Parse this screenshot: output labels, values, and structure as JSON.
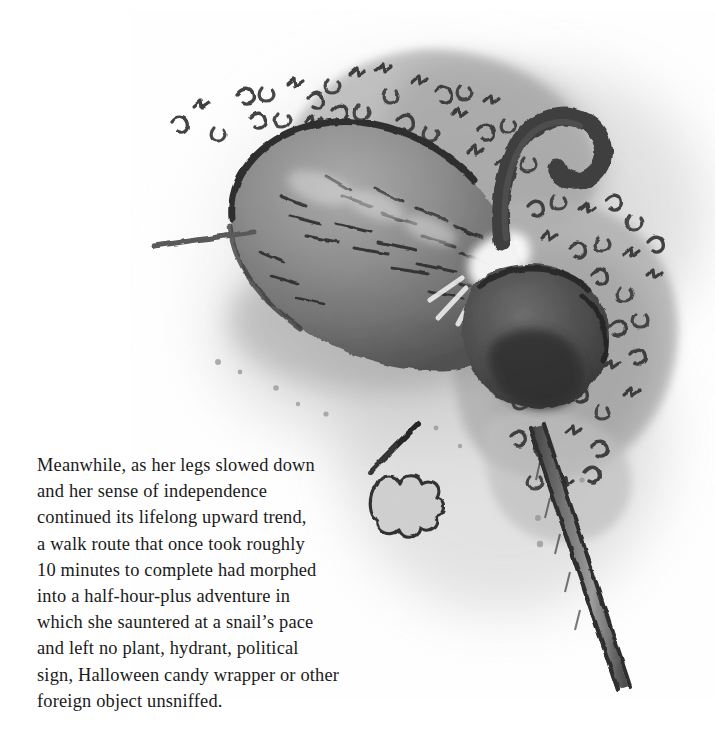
{
  "page": {
    "background_color": "#ffffff",
    "width": 715,
    "height": 747,
    "kind": "book-page-illustration-with-caption"
  },
  "illustration": {
    "title": "Dog sniffing in roadside bushes",
    "medium": "grayscale ink and wash drawing",
    "description": "Overhead rear view of a shaggy dog with a curled-up tail, nose buried in a clump of leafy bushes; a leaning sign post or plant stem runs down to the lower right and a small leaf with a twig sits at the lower left.",
    "elements": [
      {
        "name": "dog-body",
        "label": "Dog body"
      },
      {
        "name": "dog-tail",
        "label": "Curled tail"
      },
      {
        "name": "dog-head",
        "label": "Head buried in bush"
      },
      {
        "name": "bush-cluster",
        "label": "Leafy bush cluster"
      },
      {
        "name": "sign-post",
        "label": "Leaning post or stem"
      },
      {
        "name": "ground-shadow",
        "label": "Ground shadow wash"
      },
      {
        "name": "small-leaf",
        "label": "Small fallen leaf"
      },
      {
        "name": "twig",
        "label": "Thin twig"
      }
    ],
    "palette": {
      "ink": "#2f2f2f",
      "dark_fur": "#4a4a4a",
      "mid_gray": "#8e8e8e",
      "light_gray": "#b8b8b8",
      "wash": "#cfcfcf",
      "highlight": "#f2f2f2",
      "paper": "#ffffff"
    }
  },
  "caption": {
    "paragraph": "Meanwhile, as her legs slowed down and her sense of independence continued its lifelong upward trend, a walk route that once took roughly 10 minutes to complete had morphed into a half-hour-plus adventure in which she sauntered at a snail's pace and left no plant, hydrant, political sign, Halloween candy wrapper or other foreign object unsniffed.",
    "lines": [
      "Meanwhile, as her legs slowed down",
      "and her sense of independence",
      "continued its lifelong upward trend,",
      "a walk route that once took roughly",
      "10 minutes to complete had morphed",
      "into a half-hour-plus adventure in",
      "which she sauntered at a snail’s pace",
      "and left no plant, hydrant, political",
      "sign, Halloween candy wrapper or other",
      "foreign object unsniffed."
    ],
    "text_color": "#1a1a1a"
  }
}
